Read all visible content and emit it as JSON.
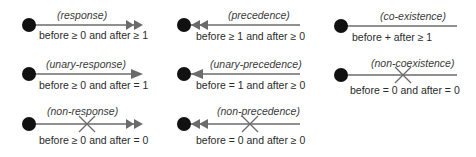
{
  "constraints": [
    {
      "name": "response",
      "label": "(response)",
      "condition": "before ≥ 0 and after ≥ 1",
      "direction": "right",
      "arrowheads": 2,
      "crossed": false
    },
    {
      "name": "precedence",
      "label": "(precedence)",
      "condition": "before ≥ 1 and after ≥ 0",
      "direction": "left",
      "arrowheads": 2,
      "crossed": false
    },
    {
      "name": "co-existence",
      "label": "(co-existence)",
      "condition": "before + after ≥ 1",
      "direction": "none",
      "arrowheads": 0,
      "crossed": false
    },
    {
      "name": "unary-response",
      "label": "(unary-response)",
      "condition": "before ≥ 0 and after = 1",
      "direction": "right",
      "arrowheads": 1,
      "crossed": false
    },
    {
      "name": "unary-precedence",
      "label": "(unary-precedence)",
      "condition": "before = 1 and after ≥ 0",
      "direction": "left",
      "arrowheads": 1,
      "crossed": false
    },
    {
      "name": "non-coexistence",
      "label": "(non-coexistence)",
      "condition": "before = 0 and after = 0",
      "direction": "none",
      "arrowheads": 0,
      "crossed": true
    },
    {
      "name": "non-response",
      "label": "(non-response)",
      "condition": "before ≥ 0 and after = 0",
      "direction": "right",
      "arrowheads": 2,
      "crossed": true
    },
    {
      "name": "non-precedence",
      "label": "(non-precedence)",
      "condition": "before = 0 and after ≥ 0",
      "direction": "left",
      "arrowheads": 2,
      "crossed": true
    }
  ],
  "colors": {
    "line": "#6b6b6b",
    "dot": "#111111",
    "text": "#2a2a2a",
    "background": "#ffffff"
  }
}
